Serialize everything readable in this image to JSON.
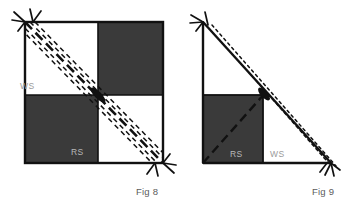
{
  "page": {
    "background_color": "#ffffff",
    "width": 350,
    "height": 210
  },
  "style": {
    "outline_color": "#111111",
    "fabric_dark_color": "#3a3a3a",
    "fabric_light_color": "#ffffff",
    "dashed_line_color": "#111111",
    "label_light_color": "#9a9a9a",
    "label_dark_color": "#b8b8b8",
    "caption_color": "#5b5b5b"
  },
  "figures": [
    {
      "id": "fig8",
      "caption": "Fig 8",
      "shape": "square",
      "description": "Four-patch checkerboard square with dark top-right and bottom-left quadrants, a solid diagonal stitching line and three dashed guide lines running corner to corner, with thread tails at the top-left and bottom-right corners.",
      "labels": [
        {
          "name": "ws-label",
          "text": "WS",
          "tone": "light"
        },
        {
          "name": "rs-label",
          "text": "RS",
          "tone": "dark"
        }
      ],
      "geometry": {
        "x": 25,
        "y": 22,
        "width": 138,
        "height": 141,
        "mid_x": 98,
        "mid_y": 95
      },
      "dark_quadrants": [
        "top-right",
        "bottom-left"
      ],
      "solid_diagonal": {
        "from": [
          25,
          22
        ],
        "to": [
          163,
          163
        ]
      },
      "dashed_offsets": [
        -11,
        -6,
        5,
        10
      ],
      "thread_tails": [
        {
          "name": "thread-tail-top-left",
          "x": 25,
          "y": 22
        },
        {
          "name": "thread-tail-bottom-right",
          "x": 163,
          "y": 163
        }
      ]
    },
    {
      "id": "fig9",
      "caption": "Fig 9",
      "shape": "right-triangle",
      "description": "Right triangle folded from the square with a dark square patch at the lower left, a dashed diagonal seam line and a dotted guide line parallel to the hypotenuse, with thread tails at the top and bottom-right corners.",
      "labels": [
        {
          "name": "rs-label",
          "text": "RS",
          "tone": "dark"
        },
        {
          "name": "ws-label",
          "text": "WS",
          "tone": "light"
        }
      ],
      "geometry": {
        "apex": [
          203,
          22
        ],
        "right_angle": [
          203,
          163
        ],
        "base_end": [
          331,
          163
        ],
        "dark_square": {
          "x": 203,
          "y": 95,
          "width": 60,
          "height": 68
        }
      },
      "thread_tails": [
        {
          "name": "thread-tail-top-left",
          "x": 203,
          "y": 22
        },
        {
          "name": "thread-tail-bottom-right",
          "x": 331,
          "y": 163
        }
      ]
    }
  ]
}
